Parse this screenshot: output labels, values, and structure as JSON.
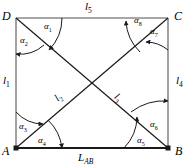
{
  "figure": {
    "type": "geometry-diagram",
    "shape": "quadrilateral-with-diagonals",
    "background_color": "#ffffff",
    "line_color": "#1a1a1a",
    "frame_color": "#8a8a8a"
  },
  "vertices": [
    {
      "id": "D",
      "label": "D",
      "x": 16,
      "y": 18,
      "corner": "top-left"
    },
    {
      "id": "C",
      "label": "C",
      "x": 168,
      "y": 18,
      "corner": "top-right"
    },
    {
      "id": "A",
      "label": "A",
      "x": 16,
      "y": 148,
      "corner": "bottom-left"
    },
    {
      "id": "B",
      "label": "B",
      "x": 168,
      "y": 148,
      "corner": "bottom-right"
    }
  ],
  "sides": [
    {
      "id": "l1",
      "label": "l",
      "subscript": "1",
      "position": "left"
    },
    {
      "id": "l4",
      "label": "l",
      "subscript": "4",
      "position": "right"
    },
    {
      "id": "l5",
      "label": "l",
      "subscript": "5",
      "position": "top"
    },
    {
      "id": "LAB",
      "label": "L",
      "subscript": "AB",
      "position": "bottom"
    }
  ],
  "diagonals": [
    {
      "id": "l2",
      "label": "l",
      "subscript": "2",
      "from": "A",
      "to": "C"
    },
    {
      "id": "l3",
      "label": "l",
      "subscript": "3",
      "from": "B",
      "to": "D"
    }
  ],
  "angles": [
    {
      "id": "a1",
      "symbol": "α",
      "subscript": "1",
      "vertex": "D",
      "x": 46,
      "y": 26
    },
    {
      "id": "a2",
      "symbol": "α",
      "subscript": "2",
      "vertex": "D",
      "x": 22,
      "y": 40
    },
    {
      "id": "a3",
      "symbol": "α",
      "subscript": "3",
      "vertex": "A",
      "x": 21,
      "y": 126
    },
    {
      "id": "a4",
      "symbol": "α",
      "subscript": "4",
      "vertex": "A",
      "x": 41,
      "y": 139
    },
    {
      "id": "a5",
      "symbol": "α",
      "subscript": "5",
      "vertex": "B",
      "x": 139,
      "y": 139
    },
    {
      "id": "a6",
      "symbol": "α",
      "subscript": "6",
      "vertex": "B",
      "x": 153,
      "y": 124
    },
    {
      "id": "a7",
      "symbol": "α",
      "subscript": "7",
      "vertex": "C",
      "x": 153,
      "y": 31
    },
    {
      "id": "a8",
      "symbol": "α",
      "subscript": "8",
      "vertex": "C",
      "x": 138,
      "y": 20
    }
  ]
}
